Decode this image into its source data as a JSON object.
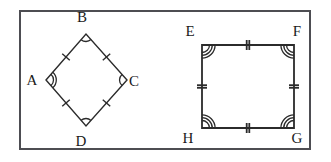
{
  "figure": {
    "border": {
      "name": "outer-frame",
      "x": 20,
      "y": 11,
      "width": 290,
      "height": 138,
      "stroke": "#4d4d52",
      "stroke_width": 2,
      "fill": "#ffffff"
    },
    "stroke_color": "#2b2b2b",
    "label_color": "#1a1a1a",
    "shapes": [
      {
        "id": "rhombus-abcd",
        "name": "rhombus ABCD",
        "kind": "rhombus",
        "stroke_width": 1.4,
        "vertices": [
          {
            "label": "A",
            "x": 46,
            "y": 80,
            "label_x": 32,
            "label_y": 85,
            "angle_arcs": 2
          },
          {
            "label": "B",
            "x": 86,
            "y": 34,
            "label_x": 82,
            "label_y": 22,
            "angle_arcs": 1
          },
          {
            "label": "C",
            "x": 127,
            "y": 80,
            "label_x": 134,
            "label_y": 86,
            "angle_arcs": 1
          },
          {
            "label": "D",
            "x": 86,
            "y": 126,
            "label_x": 81,
            "label_y": 146,
            "angle_arcs": 1
          }
        ],
        "sides": [
          {
            "name": "AB",
            "from": "A",
            "to": "B",
            "ticks": 1
          },
          {
            "name": "BC",
            "from": "B",
            "to": "C",
            "ticks": 1
          },
          {
            "name": "CD",
            "from": "C",
            "to": "D",
            "ticks": 1
          },
          {
            "name": "DA",
            "from": "D",
            "to": "A",
            "ticks": 1
          }
        ]
      },
      {
        "id": "square-efgh",
        "name": "square EFGH",
        "kind": "square",
        "stroke_width": 1.8,
        "vertices": [
          {
            "label": "E",
            "x": 202,
            "y": 45,
            "label_x": 190,
            "label_y": 36,
            "angle_arcs": 3
          },
          {
            "label": "F",
            "x": 294,
            "y": 45,
            "label_x": 297,
            "label_y": 36,
            "angle_arcs": 3
          },
          {
            "label": "G",
            "x": 294,
            "y": 128,
            "label_x": 297,
            "label_y": 143,
            "angle_arcs": 3
          },
          {
            "label": "H",
            "x": 202,
            "y": 128,
            "label_x": 188,
            "label_y": 143,
            "angle_arcs": 3
          }
        ],
        "sides": [
          {
            "name": "EF",
            "from": "E",
            "to": "F",
            "ticks": 2
          },
          {
            "name": "FG",
            "from": "F",
            "to": "G",
            "ticks": 2
          },
          {
            "name": "GH",
            "from": "G",
            "to": "H",
            "ticks": 2
          },
          {
            "name": "HE",
            "from": "H",
            "to": "E",
            "ticks": 2
          }
        ]
      }
    ]
  }
}
